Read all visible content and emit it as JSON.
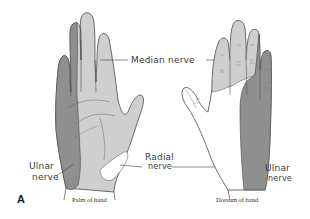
{
  "figure": {
    "panel_letter": "A",
    "colors": {
      "ulnar": "#8f8f8f",
      "median": "#cfcfcf",
      "radial": "#ffffff",
      "outline": "#4a4a4a"
    },
    "hands": [
      {
        "caption": "Palm of hand",
        "labels": {
          "median": "Median nerve",
          "ulnar_line1": "Ulnar",
          "ulnar_line2": "nerve",
          "radial_line1": "Radial",
          "radial_line2": "nerve"
        }
      },
      {
        "caption": "Dorsum of hand",
        "labels": {
          "ulnar_line1": "Ulnar",
          "ulnar_line2": "nerve"
        }
      }
    ]
  }
}
